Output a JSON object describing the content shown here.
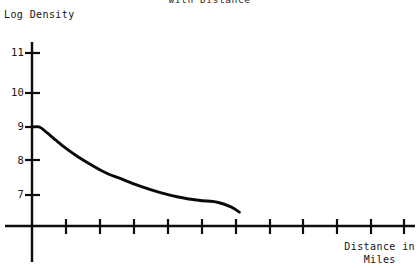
{
  "chart_data": {
    "type": "line",
    "title": "with Distance",
    "title_note": "title is clipped by the top edge of the scanned page",
    "xlabel": "Distance in\nMiles",
    "ylabel": "Log Density",
    "grid": false,
    "legend": null,
    "ylim": [
      6.0,
      11.6
    ],
    "xlim": [
      0,
      10.9
    ],
    "ytick_labels": [
      "11",
      "10",
      "9",
      "8",
      "7"
    ],
    "ytick_values": [
      11,
      10,
      9,
      8,
      7
    ],
    "xtick_labels": [
      "",
      "",
      "",
      "",
      "",
      "",
      "",
      "",
      "",
      ""
    ],
    "xtick_count": 10,
    "series": [
      {
        "name": "Log Density",
        "x": [
          0.0,
          0.22,
          0.45,
          0.7,
          1.0,
          1.35,
          1.75,
          2.2,
          2.7,
          3.2,
          3.75,
          4.3,
          4.9,
          5.45,
          5.85,
          6.1
        ],
        "values": [
          9.0,
          9.0,
          8.82,
          8.6,
          8.35,
          8.1,
          7.85,
          7.6,
          7.4,
          7.2,
          7.02,
          6.88,
          6.78,
          6.72,
          6.58,
          6.42
        ]
      }
    ]
  },
  "axes": {
    "y_labels": [
      {
        "text": "11",
        "top": 46
      },
      {
        "text": "10",
        "top": 86
      },
      {
        "text": "9",
        "top": 120
      },
      {
        "text": "8",
        "top": 154
      },
      {
        "text": "7",
        "top": 188
      }
    ]
  }
}
